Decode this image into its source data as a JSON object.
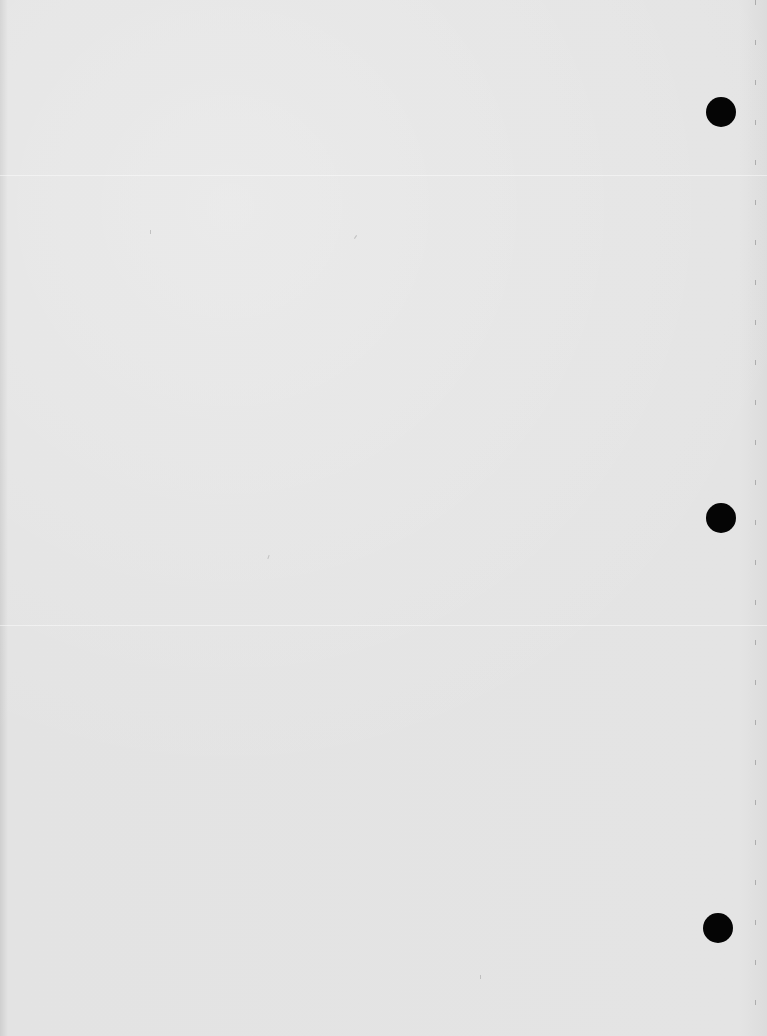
{
  "document": {
    "type": "blank scanned page",
    "text": "",
    "punch_holes": [
      {
        "x": 706,
        "y": 97
      },
      {
        "x": 706,
        "y": 503
      },
      {
        "x": 703,
        "y": 913
      }
    ],
    "colors": {
      "paper": "#e2e2e2",
      "hole": "#050505"
    }
  }
}
